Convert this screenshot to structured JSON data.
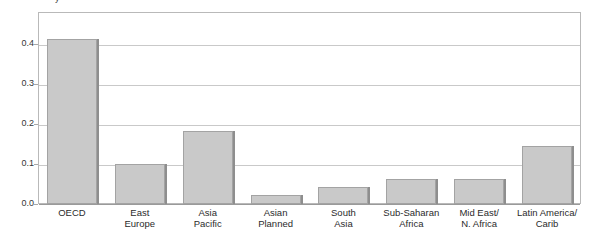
{
  "chart_data": {
    "type": "bar",
    "title": "",
    "title_remnant": "y",
    "xlabel": "",
    "ylabel": "",
    "categories": [
      "OECD",
      "East\nEurope",
      "Asia\nPacific",
      "Asian\nPlanned",
      "South\nAsia",
      "Sub-Saharan\nAfrica",
      "Mid East/\nN. Africa",
      "Latin America/\nCarib"
    ],
    "values": [
      0.413,
      0.1,
      0.182,
      0.022,
      0.042,
      0.062,
      0.062,
      0.145
    ],
    "ylim": [
      0.0,
      0.48
    ],
    "yticks": [
      0.0,
      0.1,
      0.2,
      0.3,
      0.4
    ],
    "ytick_labels": [
      "0.0",
      "0.1",
      "0.2",
      "0.3",
      "0.4"
    ],
    "grid": true,
    "legend": false,
    "bar_fill_color": "#c9c9c9",
    "bar_border_color": "#a3a3a3",
    "bar_shadow_color": "#8e8e8e",
    "gridline_color": "#c9c9c9",
    "frame_color": "#b9b9b9",
    "background_color": "#ffffff",
    "text_color": "#2b2b2b"
  }
}
